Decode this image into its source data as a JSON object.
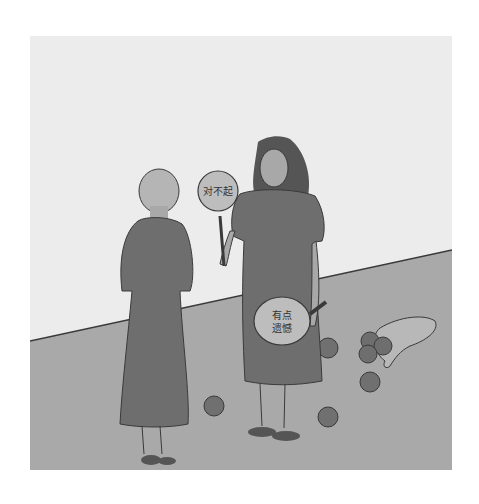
{
  "illustration": {
    "description": "Two women facing each other; one holds paddle signs",
    "colors": {
      "page_bg": "#ffffff",
      "wall": "#ececec",
      "floor": "#a9a9a9",
      "dress": "#6e6e6e",
      "skin": "#a8a8a8",
      "hair_dark": "#555555",
      "hair_light": "#b5b5b5",
      "sign": "#bdbdbd",
      "apple": "#707070",
      "shoe": "#555555",
      "outline": "#3a3a3a"
    },
    "signs": [
      {
        "id": "raised-sign",
        "text": "对不起"
      },
      {
        "id": "lowered-sign",
        "line1": "有点",
        "line2": "遗憾"
      }
    ]
  }
}
